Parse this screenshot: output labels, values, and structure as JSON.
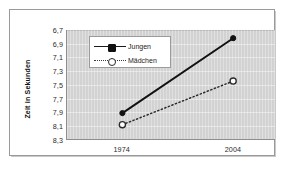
{
  "chart_data": {
    "type": "line",
    "title": "",
    "subtitle": "",
    "xlabel": "",
    "ylabel": "Zeit in Sekunden",
    "categories": [
      "1974",
      "2004"
    ],
    "x": [
      1974,
      2004
    ],
    "series": [
      {
        "name": "Jungen",
        "values": [
          7.92,
          6.82
        ],
        "line_style": "solid",
        "marker": "filled-diamond",
        "color": "#111111"
      },
      {
        "name": "Mädchen",
        "values": [
          8.09,
          7.45
        ],
        "line_style": "dotted",
        "marker": "open-circle",
        "color": "#2a2a2a"
      }
    ],
    "ylim": [
      8.3,
      6.7
    ],
    "y_inverted": true,
    "y_tick_step": 0.2,
    "ytick_labels": [
      "6,7",
      "6,9",
      "7,1",
      "7,3",
      "7,5",
      "7,7",
      "7,9",
      "8,1",
      "8,3"
    ],
    "ytick_values": [
      6.7,
      6.9,
      7.1,
      7.3,
      7.5,
      7.7,
      7.9,
      8.1,
      8.3
    ],
    "xtick_labels": [
      "1974",
      "2004"
    ],
    "grid": "horizontal",
    "legend_position": "top-left",
    "plot_background": "#d2d2d2",
    "figure_background": "#ffffff",
    "gridline_color": "#e6e6e6",
    "axis_color": "#8d8d8d"
  },
  "legend": {
    "entries": [
      {
        "label": "Jungen",
        "style": "solid",
        "marker": "filled"
      },
      {
        "label": "Mädchen",
        "style": "dotted",
        "marker": "open"
      }
    ]
  }
}
